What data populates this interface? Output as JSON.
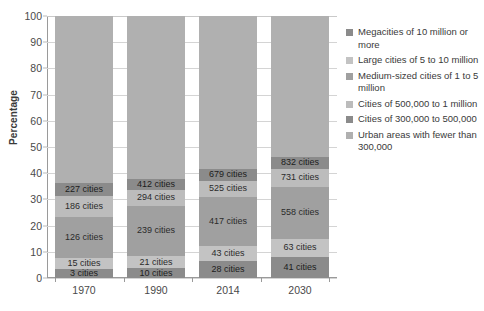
{
  "chart_data": {
    "type": "bar",
    "subtype": "stacked-bar-100-percent",
    "title": "",
    "xlabel": "",
    "ylabel": "Percentage",
    "ylim": [
      0,
      100
    ],
    "yticks": [
      0,
      10,
      20,
      30,
      40,
      50,
      60,
      70,
      80,
      90,
      100
    ],
    "grid": true,
    "legend_position": "right",
    "categories": [
      "1970",
      "1990",
      "2014",
      "2030"
    ],
    "series": [
      {
        "name": "Megacities of 10 million or more",
        "color": "#8b8b8b",
        "values": [
          3.4,
          3.8,
          6.6,
          8.1
        ],
        "labels": [
          "3 cities",
          "10 cities",
          "28 cities",
          "41 cities"
        ]
      },
      {
        "name": "Large cities of 5 to 10 million",
        "color": "#c3c3c3",
        "values": [
          4.2,
          4.6,
          5.5,
          6.9
        ],
        "labels": [
          "15 cities",
          "21 cities",
          "43 cities",
          "63 cities"
        ]
      },
      {
        "name": "Medium-sized cities of 1 to 5 million",
        "color": "#a0a0a0",
        "values": [
          15.6,
          19.2,
          18.9,
          19.8
        ],
        "labels": [
          "126 cities",
          "239 cities",
          "417 cities",
          "558 cities"
        ]
      },
      {
        "name": "Cities of 500,000 to 1 million",
        "color": "#bcbcbc",
        "values": [
          8.2,
          6.1,
          6.2,
          6.9
        ],
        "labels": [
          "186 cities",
          "294 cities",
          "525 cities",
          "731 cities"
        ]
      },
      {
        "name": "Cities of 300,000 to 500,000",
        "color": "#8b8b8b",
        "values": [
          5.0,
          4.2,
          4.6,
          4.6
        ],
        "labels": [
          "227 cities",
          "412 cities",
          "679 cities",
          "832 cities"
        ]
      },
      {
        "name": "Urban areas with fewer than 300,000",
        "color": "#b0b0b0",
        "values": [
          63.6,
          62.1,
          58.2,
          53.7
        ],
        "labels": [
          "",
          "",
          "",
          ""
        ]
      }
    ]
  },
  "axis": {
    "y_title": "Percentage",
    "y_ticks": [
      "100",
      "90",
      "80",
      "70",
      "60",
      "50",
      "40",
      "30",
      "20",
      "10",
      "0"
    ],
    "x_ticks": [
      "1970",
      "1990",
      "2014",
      "2030"
    ]
  },
  "legend": {
    "items": [
      {
        "label": "Megacities of 10 million or more",
        "color": "#8b8b8b"
      },
      {
        "label": "Large cities of 5 to 10 million",
        "color": "#c3c3c3"
      },
      {
        "label": "Medium-sized cities of 1 to 5 million",
        "color": "#a0a0a0"
      },
      {
        "label": "Cities of 500,000 to 1 million",
        "color": "#bcbcbc"
      },
      {
        "label": "Cities of 300,000 to 500,000",
        "color": "#8b8b8b"
      },
      {
        "label": "Urban areas with fewer than 300,000",
        "color": "#b0b0b0"
      }
    ]
  }
}
